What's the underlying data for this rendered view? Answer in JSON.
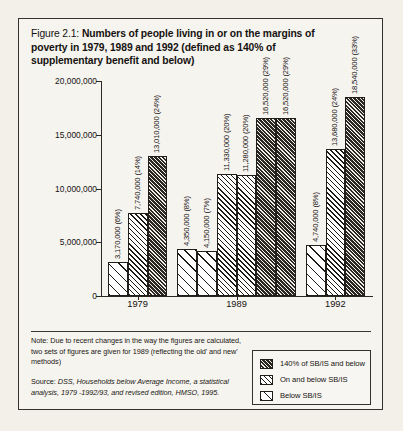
{
  "figure": {
    "number": "Figure 2.1:",
    "title": "Numbers of people living in or on the margins of poverty in 1979, 1989 and 1992 (defined as 140% of supplementary benefit and below)"
  },
  "note": {
    "text": "Note: Due to recent changes in the way the figures are calculated, two sets of figures are given for 1989 (reflecting the old' and new' methods)"
  },
  "source": {
    "lead": "Source:",
    "text": " DSS, Households below Average Income, a statistical analysis, 1979 -1992/93, and revised edition, HMSO, 1995."
  },
  "legend": {
    "items": [
      {
        "label": "140% of SB/IS and below",
        "pattern": "pat-dark"
      },
      {
        "label": "On and below SB/IS",
        "pattern": "pat-mid"
      },
      {
        "label": "Below SB/IS",
        "pattern": "pat-light"
      }
    ]
  },
  "chart_data": {
    "type": "bar",
    "title": "Numbers of people living in or on the margins of poverty in 1979, 1989 and 1992 (defined as 140% of supplementary benefit and below)",
    "xlabel": "",
    "ylabel": "",
    "ylim": [
      0,
      20000000
    ],
    "grid": false,
    "legend_position": "bottom-right",
    "ytick_labels": [
      "0",
      "5,000,000",
      "10,000,000",
      "15,000,000",
      "20,000,000"
    ],
    "ytick_values": [
      0,
      5000000,
      10000000,
      15000000,
      20000000
    ],
    "categories": [
      "1979",
      "1989",
      "1992"
    ],
    "series": [
      {
        "name": "Below SB/IS",
        "pattern": "pat-light"
      },
      {
        "name": "On and below SB/IS",
        "pattern": "pat-mid"
      },
      {
        "name": "140% of SB/IS and below",
        "pattern": "pat-dark"
      }
    ],
    "groups": [
      {
        "category": "1979",
        "bars": [
          {
            "value": 3170000,
            "percent": "6%",
            "label": "3,170,000 (6%)",
            "pattern": "pat-light",
            "series": "Below SB/IS"
          },
          {
            "value": 7740000,
            "percent": "14%",
            "label": "7,740,000 (14%)",
            "pattern": "pat-mid",
            "series": "On and below SB/IS"
          },
          {
            "value": 13010000,
            "percent": "24%",
            "label": "13,010,000 (24%)",
            "pattern": "pat-dark",
            "series": "140% of SB/IS and below"
          }
        ]
      },
      {
        "category": "1989",
        "bars": [
          {
            "value": 4350000,
            "percent": "8%",
            "label": "4,350,000 (8%)",
            "pattern": "pat-light",
            "series": "Below SB/IS"
          },
          {
            "value": 4150000,
            "percent": "7%",
            "label": "4,150,000 (7%)",
            "pattern": "pat-light",
            "series": "Below SB/IS"
          },
          {
            "value": 11330000,
            "percent": "20%",
            "label": "11,330,000 (20%)",
            "pattern": "pat-mid",
            "series": "On and below SB/IS"
          },
          {
            "value": 11280000,
            "percent": "20%",
            "label": "11,280,000 (20%)",
            "pattern": "pat-mid",
            "series": "On and below SB/IS"
          },
          {
            "value": 16520000,
            "percent": "29%",
            "label": "16,520,000 (29%)",
            "pattern": "pat-dark",
            "series": "140% of SB/IS and below"
          },
          {
            "value": 16520000,
            "percent": "29%",
            "label": "16,520,000 (29%)",
            "pattern": "pat-dark",
            "series": "140% of SB/IS and below"
          }
        ]
      },
      {
        "category": "1992",
        "bars": [
          {
            "value": 4740000,
            "percent": "8%",
            "label": "4,740,000 (8%)",
            "pattern": "pat-light",
            "series": "Below SB/IS"
          },
          {
            "value": 13680000,
            "percent": "24%",
            "label": "13,680,000 (24%)",
            "pattern": "pat-mid",
            "series": "On and below SB/IS"
          },
          {
            "value": 18540000,
            "percent": "33%",
            "label": "18,540,000 (33%)",
            "pattern": "pat-dark",
            "series": "140% of SB/IS and below"
          }
        ]
      }
    ]
  }
}
